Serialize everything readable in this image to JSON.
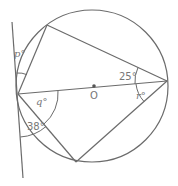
{
  "diagram": {
    "type": "circle-geometry",
    "center_label": "O",
    "angles": {
      "p": "p°",
      "q": "q°",
      "r": "r°",
      "given_top_right": "25°",
      "given_bottom_left": "38°"
    },
    "colors": {
      "stroke": "#6b6b6b",
      "label": "#777777",
      "background": "#ffffff"
    }
  }
}
